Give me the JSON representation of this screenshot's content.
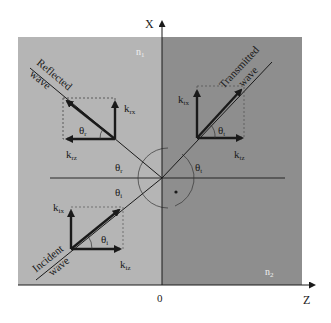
{
  "diagram": {
    "type": "optics-refraction-wavevector-diagram",
    "axes": {
      "vertical_label": "X",
      "horizontal_label": "Z",
      "origin_label": "0"
    },
    "media": {
      "upper_left": "n",
      "upper_left_sub": "1",
      "lower_right": "n",
      "lower_right_sub": "2"
    },
    "waves": {
      "reflected_line1": "Reflected",
      "reflected_line2": "wave",
      "transmitted_line1": "Transmitted",
      "transmitted_line2": "wave",
      "incident_line1": "Incident",
      "incident_line2": "wave"
    },
    "components": {
      "krx": {
        "k": "k",
        "sub": "rx"
      },
      "krz": {
        "k": "k",
        "sub": "rz"
      },
      "ktx": {
        "k": "k",
        "sub": "tx"
      },
      "ktz": {
        "k": "k",
        "sub": "tz"
      },
      "kix": {
        "k": "k",
        "sub": "ix"
      },
      "kiz": {
        "k": "k",
        "sub": "iz"
      }
    },
    "angles": {
      "theta_r": {
        "sym": "θ",
        "sub": "r"
      },
      "theta_t": {
        "sym": "θ",
        "sub": "t"
      },
      "theta_i": {
        "sym": "θ",
        "sub": "i"
      }
    },
    "colors": {
      "medium1": "#b5b5b5",
      "medium2": "#8e8e8e",
      "line": "#1a1a1a"
    }
  }
}
